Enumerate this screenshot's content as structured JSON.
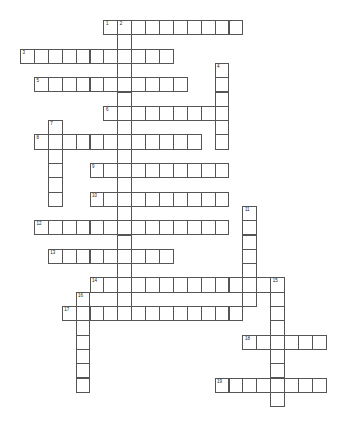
{
  "puzzle": {
    "type": "crossword",
    "grid_origin": {
      "x": 20,
      "y": 20
    },
    "cell_size": {
      "w": 13.9,
      "h": 14.3
    },
    "colors": {
      "border": "#555555",
      "cell_bg": "#ffffff",
      "number": "#222222"
    },
    "words": [
      {
        "number": "1",
        "direction": "across",
        "row": 0,
        "col": 6,
        "length": 10
      },
      {
        "number": "2",
        "direction": "down",
        "row": 0,
        "col": 7,
        "length": 21
      },
      {
        "number": "3",
        "direction": "across",
        "row": 2,
        "col": 0,
        "length": 11
      },
      {
        "number": "4",
        "direction": "down",
        "row": 3,
        "col": 14,
        "length": 6
      },
      {
        "number": "5",
        "direction": "across",
        "row": 4,
        "col": 1,
        "length": 11
      },
      {
        "number": "6",
        "direction": "across",
        "row": 6,
        "col": 6,
        "length": 9
      },
      {
        "number": "7",
        "direction": "down",
        "row": 7,
        "col": 2,
        "length": 6
      },
      {
        "number": "8",
        "direction": "across",
        "row": 8,
        "col": 1,
        "length": 12
      },
      {
        "number": "9",
        "direction": "across",
        "row": 10,
        "col": 5,
        "length": 10
      },
      {
        "number": "10",
        "direction": "across",
        "row": 12,
        "col": 5,
        "length": 10
      },
      {
        "number": "11",
        "direction": "down",
        "row": 13,
        "col": 16,
        "length": 7
      },
      {
        "number": "12",
        "direction": "across",
        "row": 14,
        "col": 1,
        "length": 14
      },
      {
        "number": "13",
        "direction": "across",
        "row": 16,
        "col": 2,
        "length": 9
      },
      {
        "number": "14",
        "direction": "across",
        "row": 18,
        "col": 5,
        "length": 14
      },
      {
        "number": "15",
        "direction": "down",
        "row": 18,
        "col": 18,
        "length": 9
      },
      {
        "number": "16",
        "direction": "down",
        "row": 19,
        "col": 4,
        "length": 7
      },
      {
        "number": "17",
        "direction": "across",
        "row": 20,
        "col": 3,
        "length": 13
      },
      {
        "number": "18",
        "direction": "across",
        "row": 22,
        "col": 16,
        "length": 6
      },
      {
        "number": "19",
        "direction": "across",
        "row": 25,
        "col": 14,
        "length": 8
      }
    ]
  }
}
